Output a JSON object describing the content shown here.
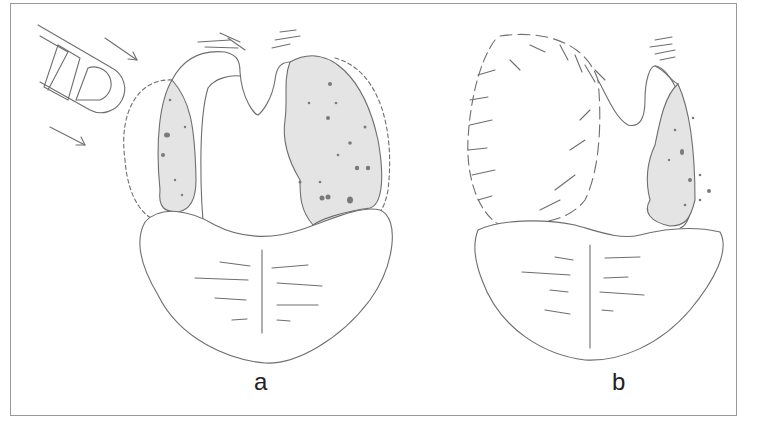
{
  "figure": {
    "panels": [
      {
        "id": "a",
        "label": "a",
        "description": "Tonsils with tonsillar swelling, dotted outline indicating extent; instrument with arrows on left"
      },
      {
        "id": "b",
        "label": "b",
        "description": "Hatched/fuzzy mass on left side; right tonsil shaded"
      }
    ]
  },
  "colors": {
    "line": "#6e6e6e",
    "shade": "#e4e4e4",
    "spot": "#7a7a7a",
    "frame": "#9a9a9a"
  }
}
